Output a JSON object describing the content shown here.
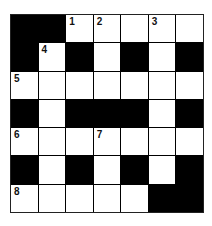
{
  "puzzle": {
    "rows": 7,
    "cols": 7,
    "colors": {
      "block": "#000000",
      "open": "#ffffff"
    },
    "grid": [
      [
        "B",
        "B",
        "W",
        "W",
        "W",
        "W",
        "W"
      ],
      [
        "B",
        "W",
        "B",
        "W",
        "B",
        "W",
        "B"
      ],
      [
        "W",
        "W",
        "W",
        "W",
        "W",
        "W",
        "W"
      ],
      [
        "B",
        "W",
        "B",
        "B",
        "B",
        "W",
        "B"
      ],
      [
        "W",
        "W",
        "W",
        "W",
        "W",
        "W",
        "W"
      ],
      [
        "B",
        "W",
        "B",
        "W",
        "B",
        "W",
        "B"
      ],
      [
        "W",
        "W",
        "W",
        "W",
        "W",
        "B",
        "B"
      ]
    ],
    "numbers": [
      [
        "",
        "",
        "1",
        "2",
        "",
        "3",
        ""
      ],
      [
        "",
        "4",
        "",
        "",
        "",
        "",
        ""
      ],
      [
        "5",
        "",
        "",
        "",
        "",
        "",
        ""
      ],
      [
        "",
        "",
        "",
        "",
        "",
        "",
        ""
      ],
      [
        "6",
        "",
        "",
        "7",
        "",
        "",
        ""
      ],
      [
        "",
        "",
        "",
        "",
        "",
        "",
        ""
      ],
      [
        "8",
        "",
        "",
        "",
        "",
        "",
        ""
      ]
    ]
  }
}
